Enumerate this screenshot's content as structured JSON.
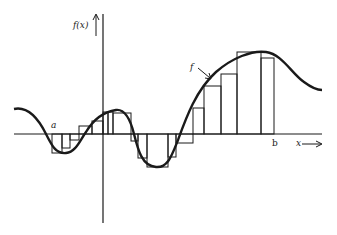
{
  "diagram": {
    "y_axis_label": "f(x)",
    "x_axis_label": "x",
    "curve_label": "f",
    "interval_start_label": "a",
    "interval_end_label": "b",
    "colors": {
      "ink": "#1a1a1a",
      "background": "#ffffff"
    },
    "axis_y_px": 134,
    "axis_x_px": 103,
    "rectangles": [
      {
        "x0": 52,
        "x1": 62,
        "top": 153
      },
      {
        "x0": 62,
        "x1": 70,
        "top": 148
      },
      {
        "x0": 70,
        "x1": 79,
        "top": 140
      },
      {
        "x0": 79,
        "x1": 92,
        "top": 126
      },
      {
        "x0": 92,
        "x1": 103,
        "top": 121
      },
      {
        "x0": 103,
        "x1": 108,
        "top": 112
      },
      {
        "x0": 108,
        "x1": 113,
        "top": 112
      },
      {
        "x0": 113,
        "x1": 131,
        "top": 113
      },
      {
        "x0": 131,
        "x1": 138,
        "top": 141
      },
      {
        "x0": 138,
        "x1": 147,
        "top": 158
      },
      {
        "x0": 147,
        "x1": 168,
        "top": 167
      },
      {
        "x0": 168,
        "x1": 176,
        "top": 157
      },
      {
        "x0": 176,
        "x1": 193,
        "top": 143
      },
      {
        "x0": 193,
        "x1": 204,
        "top": 108
      },
      {
        "x0": 204,
        "x1": 221,
        "top": 86
      },
      {
        "x0": 221,
        "x1": 237,
        "top": 74
      },
      {
        "x0": 237,
        "x1": 261,
        "top": 52
      },
      {
        "x0": 261,
        "x1": 274,
        "top": 58
      }
    ]
  }
}
